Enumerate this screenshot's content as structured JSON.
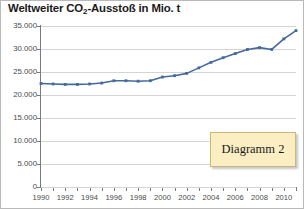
{
  "chart_data": {
    "type": "line",
    "title": "Weltweiter CO2-Ausstoß in Mio. t",
    "title_parts": {
      "before": "Weltweiter CO",
      "sub": "2",
      "after": "-Ausstoß in Mio. t"
    },
    "xlabel": "",
    "ylabel": "",
    "xlim": [
      1990,
      2011
    ],
    "ylim": [
      0,
      35000
    ],
    "grid": true,
    "legend": false,
    "series_color": "#43699f",
    "marker": "square",
    "y_ticks": [
      0,
      5000,
      10000,
      15000,
      20000,
      25000,
      30000,
      35000
    ],
    "y_tick_labels": [
      "0",
      "5.000",
      "10.000",
      "15.000",
      "20.000",
      "25.000",
      "30.000",
      "35.000"
    ],
    "x_ticks": [
      1990,
      1991,
      1992,
      1993,
      1994,
      1995,
      1996,
      1997,
      1998,
      1999,
      2000,
      2001,
      2002,
      2003,
      2004,
      2005,
      2006,
      2007,
      2008,
      2009,
      2010,
      2011
    ],
    "x_tick_labels_shown": [
      "1990",
      "1992",
      "1994",
      "1996",
      "1998",
      "2000",
      "2002",
      "2004",
      "2006",
      "2008",
      "2010"
    ],
    "x": [
      1990,
      1991,
      1992,
      1993,
      1994,
      1995,
      1996,
      1997,
      1998,
      1999,
      2000,
      2001,
      2002,
      2003,
      2004,
      2005,
      2006,
      2007,
      2008,
      2009,
      2010,
      2011
    ],
    "values": [
      22500,
      22400,
      22300,
      22300,
      22400,
      22600,
      23100,
      23100,
      23000,
      23100,
      23900,
      24200,
      24700,
      25900,
      27100,
      28100,
      29000,
      29900,
      30300,
      29900,
      32200,
      34000
    ],
    "annotations": [
      {
        "text": "Diagramm 2",
        "kind": "callout-box"
      }
    ]
  },
  "callout": {
    "label": "Diagramm 2",
    "background": "#faeec2",
    "border_color": "#ccb77a"
  }
}
